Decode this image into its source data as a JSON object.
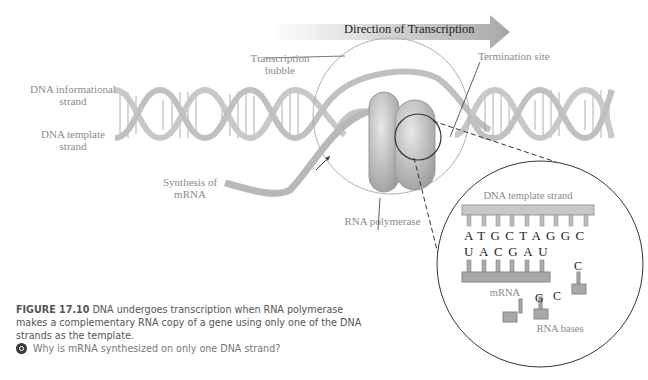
{
  "figure": {
    "direction_label": "Direction of Transcription",
    "labels": {
      "informational_strand": [
        "DNA informational",
        "strand"
      ],
      "template_strand": [
        "DNA template",
        "strand"
      ],
      "transcription_bubble": [
        "Transcription",
        "bubble"
      ],
      "termination_site": "Termination site",
      "synthesis_mrna": [
        "Synthesis of",
        "mRNA"
      ],
      "rna_polymerase": "RNA polymerase"
    },
    "inset": {
      "title": "DNA template strand",
      "dna_bases": [
        "A",
        "T",
        "G",
        "C",
        "T",
        "A",
        "G",
        "G",
        "C"
      ],
      "mrna_bases": [
        "U",
        "A",
        "C",
        "G",
        "A",
        "U"
      ],
      "mrna_label": "mRNA",
      "free_bases": [
        "G",
        "C",
        "C"
      ],
      "free_bases_label": "RNA bases"
    }
  },
  "caption": {
    "number": "FIGURE 17.10",
    "text": "DNA undergoes transcription when RNA polymerase makes a complementary RNA copy of a gene using only one of the DNA strands as the template.",
    "question": "Why is mRNA synthesized on only one DNA strand?"
  },
  "colors": {
    "strand": "#c8c8c8",
    "strand_edge": "#8f8f8f",
    "arrow_grad_start": "#ffffff",
    "arrow_grad_end": "#a9a9a9",
    "label_gray": "#8a8a8a"
  }
}
